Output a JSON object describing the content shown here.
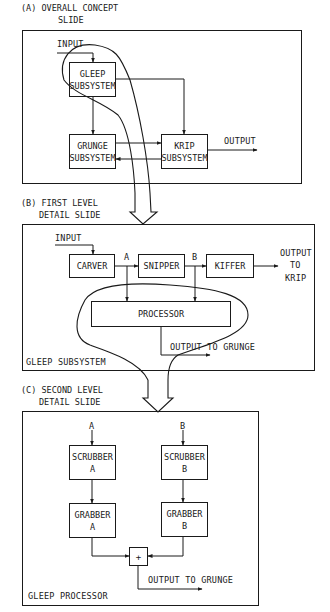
{
  "panels": [
    {
      "id": "a",
      "caption_line1": "(A) OVERALL CONCEPT",
      "caption_line2": "SLIDE",
      "inputs": [
        "INPUT"
      ],
      "outputs": [
        "OUTPUT"
      ],
      "blocks": [
        {
          "line1": "GLEEP",
          "line2": "SUBSYSTEM"
        },
        {
          "line1": "GRUNGE",
          "line2": "SUBSYSTEM"
        },
        {
          "line1": "KRIP",
          "line2": "SUBSYSTEM"
        }
      ]
    },
    {
      "id": "b",
      "caption_line1": "(B) FIRST LEVEL",
      "caption_line2": "DETAIL SLIDE",
      "input_label": "INPUT",
      "blocks": [
        {
          "label": "CARVER"
        },
        {
          "label": "SNIPPER"
        },
        {
          "label": "KIFFER"
        },
        {
          "label": "PROCESSOR"
        }
      ],
      "node_a": "A",
      "node_b": "B",
      "output_line1": "OUTPUT",
      "output_line2": "TO",
      "output_line3": "KRIP",
      "output_grunge": "OUTPUT TO GRUNGE",
      "frame_label": "GLEEP SUBSYSTEM"
    },
    {
      "id": "c",
      "caption_line1": "(C) SECOND LEVEL",
      "caption_line2": "DETAIL SLIDE",
      "input_a": "A",
      "input_b": "B",
      "blocks": [
        {
          "line1": "SCRUBBER",
          "line2": "A"
        },
        {
          "line1": "SCRUBBER",
          "line2": "B"
        },
        {
          "line1": "GRABBER",
          "line2": "A"
        },
        {
          "line1": "GRABBER",
          "line2": "B"
        }
      ],
      "summer_symbol": "+",
      "output_grunge": "OUTPUT TO GRUNGE",
      "frame_label": "GLEEP PROCESSOR"
    }
  ]
}
